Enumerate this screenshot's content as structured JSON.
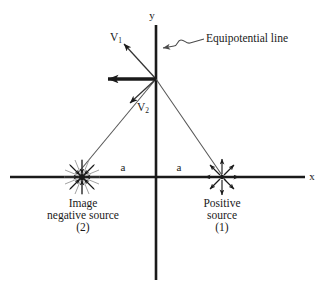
{
  "figure": {
    "background_color": "#ffffff",
    "stroke_color": "#1a1a1a",
    "width": 327,
    "height": 293
  },
  "axes": {
    "x_label": "x",
    "y_label": "y",
    "x_axis": {
      "x1": 10,
      "y1": 177,
      "x2": 305,
      "y2": 177
    },
    "y_axis": {
      "x1": 156,
      "y1": 25,
      "x2": 156,
      "y2": 280
    },
    "x_label_pos": {
      "x": 311,
      "y": 177
    },
    "y_label_pos": {
      "x": 152,
      "y": 16
    }
  },
  "origin": {
    "x": 156,
    "y": 177
  },
  "field_point": {
    "x": 156,
    "y": 79
  },
  "vectors": [
    {
      "name": "V1",
      "label": "V",
      "subscript": "1",
      "label_pos": {
        "x": 116,
        "y": 38
      },
      "from": {
        "x": 156,
        "y": 79
      },
      "to": {
        "x": 123,
        "y": 43
      },
      "style": "thin-arrow"
    },
    {
      "name": "V2",
      "label": "V",
      "subscript": "2",
      "label_pos": {
        "x": 142,
        "y": 108
      },
      "from": {
        "x": 156,
        "y": 79
      },
      "to": {
        "x": 127,
        "y": 106
      },
      "style": "thin-arrow"
    },
    {
      "name": "resultant",
      "label": "",
      "subscript": "",
      "label_pos": {
        "x": 0,
        "y": 0
      },
      "from": {
        "x": 156,
        "y": 79
      },
      "to": {
        "x": 104,
        "y": 79
      },
      "style": "thick-arrow"
    }
  ],
  "rays": [
    {
      "name": "ray-to-negative-source",
      "from": {
        "x": 156,
        "y": 79
      },
      "to": {
        "x": 78,
        "y": 173
      }
    },
    {
      "name": "ray-to-positive-source",
      "from": {
        "x": 156,
        "y": 79
      },
      "to": {
        "x": 226,
        "y": 181
      }
    }
  ],
  "callout": {
    "text": "Equipotential line",
    "text_pos": {
      "x": 206,
      "y": 40
    },
    "leader_start": {
      "x": 204,
      "y": 40
    },
    "leader_end": {
      "x": 159,
      "y": 50
    }
  },
  "sources": [
    {
      "name": "negative-source",
      "polarity": "negative",
      "center": {
        "x": 82,
        "y": 177
      },
      "radius": 17,
      "caption_lines": [
        "Image",
        "negative source",
        "(2)"
      ],
      "caption_pos": {
        "x": 83,
        "y": 198
      }
    },
    {
      "name": "positive-source",
      "polarity": "positive",
      "center": {
        "x": 222,
        "y": 177
      },
      "radius": 17,
      "caption_lines": [
        "Positive",
        "source",
        "(1)"
      ],
      "caption_pos": {
        "x": 222,
        "y": 198
      }
    }
  ],
  "distance_labels": [
    {
      "name": "distance-a-left",
      "text": "a",
      "pos": {
        "x": 123,
        "y": 168
      }
    },
    {
      "name": "distance-a-right",
      "text": "a",
      "pos": {
        "x": 179,
        "y": 168
      }
    }
  ]
}
